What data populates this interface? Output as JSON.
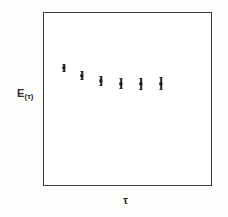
{
  "figure": {
    "width": 228,
    "height": 217,
    "background_color": "#fdfdfc",
    "ink_color": "#2b2b2b"
  },
  "axes": {
    "frame": {
      "left": 43,
      "top": 12,
      "right": 212,
      "bottom": 186
    },
    "frame_color": "#3c3c3c",
    "ticks_visible": false,
    "gridlines_visible": false,
    "tick_labels_visible": false,
    "y_label": {
      "text": "E",
      "subscript": "(τ)",
      "x": 17,
      "y": 88
    },
    "x_label": {
      "text": "τ",
      "x": 123,
      "y": 195
    }
  },
  "chart_data": {
    "type": "scatter",
    "title": "",
    "subtitle": "",
    "xlabel": "τ",
    "ylabel": "E(τ)",
    "grid": false,
    "legend": null,
    "axis_ticks_labeled": false,
    "xlim": [
      0,
      1
    ],
    "ylim": [
      0,
      1
    ],
    "note": "Axis values are unlabeled in the figure; x and y are given in normalized axes fraction as read off the plot frame.",
    "series": [
      {
        "name": "E(τ)",
        "marker": "square",
        "color": "#1b1b1b",
        "points": [
          {
            "index": 1,
            "x_px": 64,
            "y_px": 68,
            "x_frac": 0.124,
            "y_frac": 0.678,
            "yerr_px": 3.5
          },
          {
            "index": 2,
            "x_px": 82,
            "y_px": 76,
            "x_frac": 0.231,
            "y_frac": 0.632,
            "yerr_px": 4.0
          },
          {
            "index": 3,
            "x_px": 101,
            "y_px": 81,
            "x_frac": 0.343,
            "y_frac": 0.603,
            "yerr_px": 4.5
          },
          {
            "index": 4,
            "x_px": 121,
            "y_px": 84,
            "x_frac": 0.462,
            "y_frac": 0.586,
            "yerr_px": 5.0
          },
          {
            "index": 5,
            "x_px": 141,
            "y_px": 84,
            "x_frac": 0.58,
            "y_frac": 0.586,
            "yerr_px": 5.5
          },
          {
            "index": 6,
            "x_px": 161,
            "y_px": 84,
            "x_frac": 0.698,
            "y_frac": 0.586,
            "yerr_px": 6.0
          }
        ]
      }
    ]
  }
}
